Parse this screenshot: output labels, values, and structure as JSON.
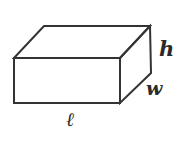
{
  "diagram": {
    "type": "rectangular-prism",
    "stroke_color": "#333333",
    "background_color": "#ffffff",
    "labels": {
      "height": "h",
      "width": "w",
      "length": "ℓ"
    }
  }
}
